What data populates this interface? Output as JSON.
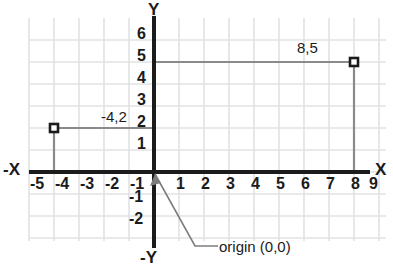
{
  "chart_data": {
    "type": "scatter",
    "title": "",
    "xlabel": "X",
    "ylabel": "Y",
    "neg_xlabel": "-X",
    "neg_ylabel": "-Y",
    "xlim": [
      -5.7,
      9.7
    ],
    "ylim": [
      -2.9,
      6.6
    ],
    "grid": true,
    "grid_spacing": 1,
    "x_ticks": [
      "-5",
      "-4",
      "-3",
      "-2",
      "-1",
      "1",
      "2",
      "3",
      "4",
      "5",
      "6",
      "7",
      "8",
      "9"
    ],
    "x_tick_values": [
      -5,
      -4,
      -3,
      -2,
      -1,
      1,
      2,
      3,
      4,
      5,
      6,
      7,
      8,
      9
    ],
    "y_ticks": [
      "6",
      "5",
      "4",
      "3",
      "2",
      "1",
      "-1",
      "-2"
    ],
    "y_tick_values": [
      6,
      5,
      4,
      3,
      2,
      1,
      -1,
      -2
    ],
    "points": [
      {
        "label": "-4,2",
        "x": -4,
        "y": 2
      },
      {
        "label": "8,5",
        "x": 8,
        "y": 5
      }
    ],
    "annotations": [
      {
        "text": "origin (0,0)",
        "x": 0,
        "y": 0
      }
    ],
    "colors": {
      "axis": "#1b1b1b",
      "grid": "#e2e2e4",
      "point_marker": "#1b1b1b",
      "point_line": "#8a8a8a",
      "leader": "#7d7d7d",
      "text": "#1b1b1b",
      "background": "#ffffff"
    }
  }
}
